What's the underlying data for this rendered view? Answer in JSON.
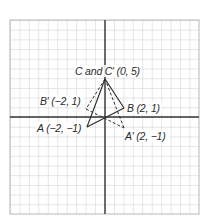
{
  "diagram": {
    "type": "coordinate-grid-reflection",
    "grid": {
      "left": 10,
      "top": 20,
      "right": 199,
      "bottom": 214,
      "cell": 9.45,
      "line_color": "#c9c9c9",
      "border_color": "#b8b8b8"
    },
    "axes": {
      "origin_px": [
        105,
        117
      ],
      "color": "#333333"
    },
    "original_triangle": {
      "name": "ABC",
      "style": "solid",
      "vertices": [
        {
          "name": "A",
          "coords": [
            -2,
            -1
          ],
          "px": [
            87,
            127
          ]
        },
        {
          "name": "B",
          "coords": [
            2,
            1
          ],
          "px": [
            124,
            108
          ]
        },
        {
          "name": "C",
          "coords": [
            0,
            5
          ],
          "px": [
            105,
            79
          ]
        }
      ]
    },
    "image_triangle": {
      "name": "A'B'C'",
      "style": "dashed",
      "vertices": [
        {
          "name": "A'",
          "coords": [
            2,
            -1
          ],
          "px": [
            124,
            128
          ]
        },
        {
          "name": "B'",
          "coords": [
            -2,
            1
          ],
          "px": [
            86,
            109
          ]
        },
        {
          "name": "C'",
          "coords": [
            0,
            5
          ],
          "px": [
            105,
            79
          ]
        }
      ]
    },
    "labels": {
      "c": "C and C′ (0, 5)",
      "b_prime": "B′ (−2, 1)",
      "b": "B (2, 1)",
      "a": "A (−2, −1)",
      "a_prime": "A′ (2, −1)"
    },
    "stroke_color": "#2f2f2f"
  }
}
